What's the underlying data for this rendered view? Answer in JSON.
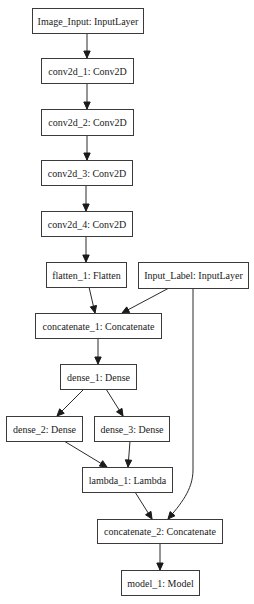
{
  "diagram": {
    "type": "keras-model-graph",
    "nodes": [
      {
        "id": "image_input",
        "label": "Image_Input: InputLayer",
        "x": 32,
        "y": 8,
        "w": 111,
        "h": 25
      },
      {
        "id": "conv2d_1",
        "label": "conv2d_1: Conv2D",
        "x": 41,
        "y": 58,
        "w": 92,
        "h": 25
      },
      {
        "id": "conv2d_2",
        "label": "conv2d_2: Conv2D",
        "x": 41,
        "y": 109,
        "w": 92,
        "h": 26
      },
      {
        "id": "conv2d_3",
        "label": "conv2d_3: Conv2D",
        "x": 41,
        "y": 160,
        "w": 91,
        "h": 25
      },
      {
        "id": "conv2d_4",
        "label": "conv2d_4: Conv2D",
        "x": 41,
        "y": 211,
        "w": 91,
        "h": 25
      },
      {
        "id": "flatten_1",
        "label": "flatten_1: Flatten",
        "x": 46,
        "y": 262,
        "w": 80,
        "h": 25
      },
      {
        "id": "input_label",
        "label": "Input_Label: InputLayer",
        "x": 138,
        "y": 262,
        "w": 110,
        "h": 26
      },
      {
        "id": "concatenate_1",
        "label": "concatenate_1: Concatenate",
        "x": 35,
        "y": 313,
        "w": 126,
        "h": 25
      },
      {
        "id": "dense_1",
        "label": "dense_1: Dense",
        "x": 60,
        "y": 364,
        "w": 76,
        "h": 25
      },
      {
        "id": "dense_2",
        "label": "dense_2: Dense",
        "x": 6,
        "y": 416,
        "w": 76,
        "h": 25
      },
      {
        "id": "dense_3",
        "label": "dense_3: Dense",
        "x": 94,
        "y": 416,
        "w": 75,
        "h": 25
      },
      {
        "id": "lambda_1",
        "label": "lambda_1: Lambda",
        "x": 82,
        "y": 467,
        "w": 90,
        "h": 25
      },
      {
        "id": "concatenate_2",
        "label": "concatenate_2: Concatenate",
        "x": 97,
        "y": 519,
        "w": 125,
        "h": 24
      },
      {
        "id": "model_1",
        "label": "model_1: Model",
        "x": 121,
        "y": 570,
        "w": 78,
        "h": 25
      }
    ],
    "edges": [
      {
        "from": "image_input",
        "to": "conv2d_1",
        "path": "M87,33 L87,58"
      },
      {
        "from": "conv2d_1",
        "to": "conv2d_2",
        "path": "M87,83 L87,109"
      },
      {
        "from": "conv2d_2",
        "to": "conv2d_3",
        "path": "M87,135 L87,160"
      },
      {
        "from": "conv2d_3",
        "to": "conv2d_4",
        "path": "M86,185 L86,211"
      },
      {
        "from": "conv2d_4",
        "to": "flatten_1",
        "path": "M86,236 L86,262"
      },
      {
        "from": "flatten_1",
        "to": "concatenate_1",
        "path": "M89,287 L95,313"
      },
      {
        "from": "input_label",
        "to": "concatenate_1",
        "path": "M169,288 L122,313"
      },
      {
        "from": "concatenate_1",
        "to": "dense_1",
        "path": "M98,338 L98,364"
      },
      {
        "from": "dense_1",
        "to": "dense_2",
        "path": "M84,389 L57,416"
      },
      {
        "from": "dense_1",
        "to": "dense_3",
        "path": "M106,389 L123,416"
      },
      {
        "from": "dense_2",
        "to": "lambda_1",
        "path": "M64,441 L107,467"
      },
      {
        "from": "dense_3",
        "to": "lambda_1",
        "path": "M130,441 L128,467"
      },
      {
        "from": "lambda_1",
        "to": "concatenate_2",
        "path": "M135,492 L152,519"
      },
      {
        "from": "input_label",
        "to": "concatenate_2",
        "path": "M193,288 L193,470 C193,490 180,505 168,519"
      },
      {
        "from": "concatenate_2",
        "to": "model_1",
        "path": "M160,543 L160,570"
      }
    ],
    "colors": {
      "background": "#ffffff",
      "box_stroke": "#3a3a3a",
      "text": "#1a1a1a",
      "edge": "#2a2a2a"
    }
  }
}
